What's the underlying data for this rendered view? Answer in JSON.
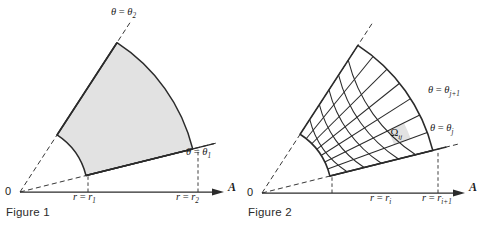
{
  "page": {
    "background": "#ffffff",
    "ink": "#2b2b2b",
    "shade_fill": "#e2e2e2",
    "width": 485,
    "height": 232
  },
  "figures": [
    {
      "id": "figure-1",
      "caption": "Figure 1",
      "description": "Shaded annular sector in polar coordinates bounded by r = r1, r = r2, theta = theta1, theta = theta2",
      "origin_label": "0",
      "axis_label": "A",
      "labels": {
        "theta_upper": {
          "lhs": "θ",
          "eq": " = ",
          "rhs": "θ",
          "sub": "2"
        },
        "theta_lower": {
          "lhs": "θ",
          "eq": " = ",
          "rhs": "θ",
          "sub": "1"
        },
        "r_inner": {
          "lhs": "r",
          "eq": " = ",
          "rhs": "r",
          "sub": "1"
        },
        "r_outer": {
          "lhs": "r",
          "eq": " = ",
          "rhs": "r",
          "sub": "2"
        }
      },
      "geometry": {
        "origin_x": 20,
        "origin_y": 192,
        "r_inner": 68,
        "r_outer": 178,
        "theta1_deg": 14,
        "theta2_deg": 57,
        "axis_end_x": 222,
        "ray_extend_inner": 22,
        "ray_extend_outer": 26
      }
    },
    {
      "id": "figure-2",
      "caption": "Figure 2",
      "description": "Same sector subdivided into a polar mesh; cell Omega ij highlighted",
      "origin_label": "0",
      "axis_label": "A",
      "cell_label": {
        "base": "Ω",
        "sub": "ij"
      },
      "labels": {
        "theta_upper": {
          "lhs": "θ",
          "eq": " = ",
          "rhs": "θ",
          "sub": "j+1"
        },
        "theta_lower": {
          "lhs": "θ",
          "eq": " = ",
          "rhs": "θ",
          "sub": "j"
        },
        "r_inner": {
          "lhs": "r",
          "eq": " = ",
          "rhs": "r",
          "sub": "i"
        },
        "r_outer": {
          "lhs": "r",
          "eq": " = ",
          "rhs": "r",
          "sub": "i+1"
        }
      },
      "geometry": {
        "origin_x": 262,
        "origin_y": 193,
        "r_inner": 70,
        "r_outer": 176,
        "theta1_deg": 14,
        "theta2_deg": 57,
        "axis_end_x": 463,
        "n_radial": 6,
        "n_angular": 7,
        "highlight_radial_index": 4,
        "highlight_angular_index": 1,
        "ray_extend_inner": 22,
        "ray_extend_outer": 26
      }
    }
  ]
}
